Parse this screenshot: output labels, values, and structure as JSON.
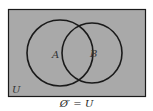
{
  "diagram": {
    "type": "venn",
    "universe_label": "U",
    "sets": [
      {
        "label": "A"
      },
      {
        "label": "B"
      }
    ],
    "shaded_region": "entire universe",
    "caption": "Ø′ = U",
    "colors": {
      "shade": "#a9a9a9",
      "stroke": "#1a1a1a",
      "background": "#ffffff"
    }
  }
}
